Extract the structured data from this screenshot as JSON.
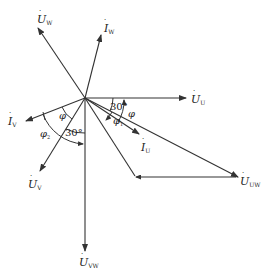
{
  "diagram": {
    "type": "phasor-diagram",
    "stroke_color": "#333333",
    "phasors": [
      {
        "id": "U_W",
        "symbol": "U",
        "sub": "W",
        "label": "U̇W"
      },
      {
        "id": "I_W",
        "symbol": "I",
        "sub": "W",
        "label": "İW"
      },
      {
        "id": "U_U",
        "symbol": "U",
        "sub": "U",
        "label": "U̇U"
      },
      {
        "id": "I_V",
        "symbol": "I",
        "sub": "V",
        "label": "İV"
      },
      {
        "id": "U_V",
        "symbol": "U",
        "sub": "V",
        "label": "U̇V"
      },
      {
        "id": "U_VW",
        "symbol": "U",
        "sub": "VW",
        "label": "U̇VW"
      },
      {
        "id": "I_U",
        "symbol": "I",
        "sub": "U",
        "label": "İU"
      },
      {
        "id": "U_UW",
        "symbol": "U",
        "sub": "UW",
        "label": "U̇UW"
      }
    ],
    "angles": {
      "a30_right": "30°",
      "a30_left": "30°",
      "phi_right": "φ",
      "phi_left": "φ",
      "phi1": "φ",
      "phi1_sub": "1",
      "phi2": "φ",
      "phi2_sub": "2"
    }
  }
}
